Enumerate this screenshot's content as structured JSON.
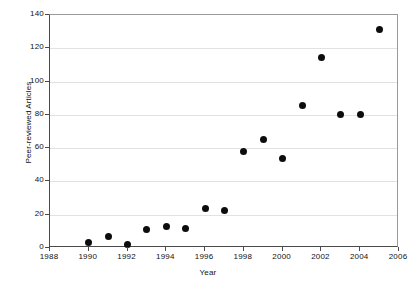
{
  "chart_data": {
    "type": "scatter",
    "title": "",
    "xlabel": "Year",
    "ylabel": "Peer-reviewed Articles",
    "xlim": [
      1988,
      2006
    ],
    "ylim": [
      0,
      140
    ],
    "xticks": [
      1988,
      1990,
      1992,
      1994,
      1996,
      1998,
      2000,
      2002,
      2004,
      2006
    ],
    "yticks": [
      0,
      20,
      40,
      60,
      80,
      100,
      120,
      140
    ],
    "xtick_labels": [
      "1988",
      "1990",
      "1992",
      "1994",
      "1996",
      "1998",
      "2000",
      "2002",
      "2004",
      "2006"
    ],
    "ytick_labels": [
      "0",
      "20",
      "40",
      "60",
      "80",
      "100",
      "120",
      "140"
    ],
    "grid": "horizontal",
    "legend": "none",
    "marker": "filled-circle",
    "marker_color": "#0d0d0d",
    "grid_color": "#e2e2e2",
    "axis_color": "#4a4a4a",
    "x": [
      1990,
      1991,
      1992,
      1993,
      1994,
      1995,
      1996,
      1997,
      1998,
      1999,
      2000,
      2001,
      2002,
      2003,
      2004,
      2005
    ],
    "values": [
      3.5,
      7,
      2,
      11,
      13,
      11.5,
      24,
      22.5,
      58,
      65,
      54,
      85.5,
      114.5,
      80.5,
      80.5,
      131.5
    ],
    "points": [
      {
        "x": 1990,
        "y": 3.5
      },
      {
        "x": 1991,
        "y": 7
      },
      {
        "x": 1992,
        "y": 2
      },
      {
        "x": 1993,
        "y": 11
      },
      {
        "x": 1994,
        "y": 13
      },
      {
        "x": 1995,
        "y": 11.5
      },
      {
        "x": 1996,
        "y": 24
      },
      {
        "x": 1997,
        "y": 22.5
      },
      {
        "x": 1998,
        "y": 58
      },
      {
        "x": 1999,
        "y": 65
      },
      {
        "x": 2000,
        "y": 54
      },
      {
        "x": 2001,
        "y": 85.5
      },
      {
        "x": 2002,
        "y": 114.5
      },
      {
        "x": 2003,
        "y": 80.5
      },
      {
        "x": 2004,
        "y": 80.5
      },
      {
        "x": 2005,
        "y": 131.5
      }
    ]
  }
}
